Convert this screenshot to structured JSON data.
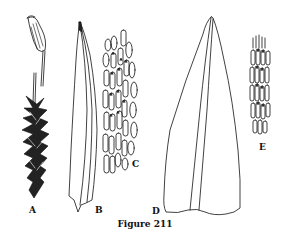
{
  "figure": {
    "caption": "Figure 211",
    "panels": [
      {
        "id": "A",
        "label": "A",
        "depicts": "whole moss plant with capsule on seta"
      },
      {
        "id": "B",
        "label": "B",
        "depicts": "leaf, narrow lanceolate with costa"
      },
      {
        "id": "C",
        "label": "C",
        "depicts": "leaf cells, elongate with papillae"
      },
      {
        "id": "D",
        "label": "D",
        "depicts": "leaf, broad triangular with costa"
      },
      {
        "id": "E",
        "label": "E",
        "depicts": "leaf cells, narrow with papillae"
      }
    ]
  }
}
